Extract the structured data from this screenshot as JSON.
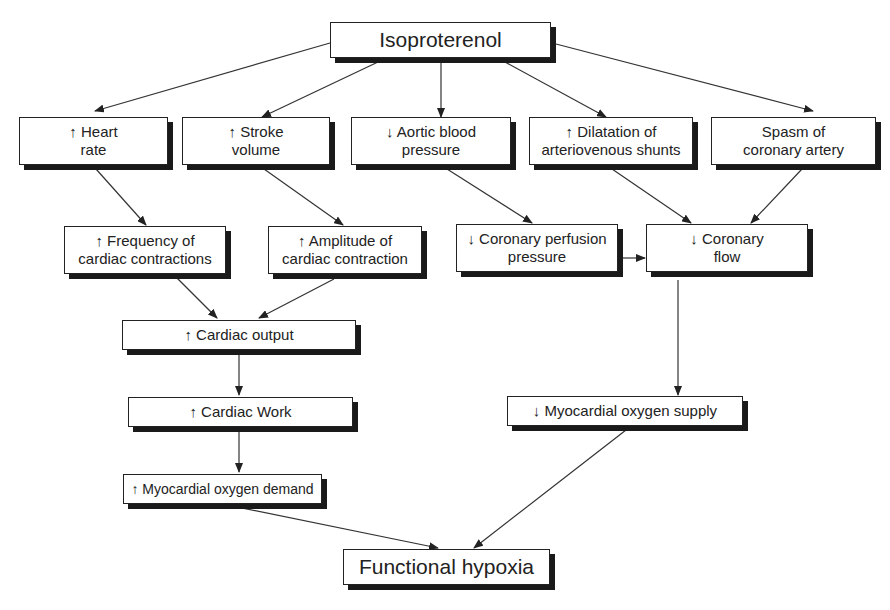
{
  "diagram": {
    "nodes": {
      "isoproterenol": {
        "lines": [
          "Isoproterenol"
        ]
      },
      "heart_rate": {
        "lines": [
          "↑ Heart",
          "rate"
        ]
      },
      "stroke_volume": {
        "lines": [
          "↑ Stroke",
          "volume"
        ]
      },
      "aortic_bp": {
        "lines": [
          "↓ Aortic blood",
          "pressure"
        ]
      },
      "av_shunts": {
        "lines": [
          "↑ Dilatation of",
          "arteriovenous shunts"
        ]
      },
      "coronary_spasm": {
        "lines": [
          "Spasm of",
          "coronary artery"
        ]
      },
      "freq_contractions": {
        "lines": [
          "↑ Frequency of",
          "cardiac contractions"
        ]
      },
      "amp_contraction": {
        "lines": [
          "↑ Amplitude of",
          "cardiac contraction"
        ]
      },
      "coronary_perfusion": {
        "lines": [
          "↓ Coronary perfusion",
          "pressure"
        ]
      },
      "coronary_flow": {
        "lines": [
          "↓ Coronary",
          "flow"
        ]
      },
      "cardiac_output": {
        "lines": [
          "↑ Cardiac output"
        ]
      },
      "cardiac_work": {
        "lines": [
          "↑ Cardiac Work"
        ]
      },
      "mo_supply": {
        "lines": [
          "↓ Myocardial oxygen supply"
        ]
      },
      "mo_demand": {
        "lines": [
          "↑ Myocardial oxygen demand"
        ]
      },
      "functional_hypoxia": {
        "lines": [
          "Functional hypoxia"
        ]
      }
    },
    "edges": [
      {
        "from": "isoproterenol",
        "to": "heart_rate"
      },
      {
        "from": "isoproterenol",
        "to": "stroke_volume"
      },
      {
        "from": "isoproterenol",
        "to": "aortic_bp"
      },
      {
        "from": "isoproterenol",
        "to": "av_shunts"
      },
      {
        "from": "isoproterenol",
        "to": "coronary_spasm"
      },
      {
        "from": "heart_rate",
        "to": "freq_contractions"
      },
      {
        "from": "stroke_volume",
        "to": "amp_contraction"
      },
      {
        "from": "aortic_bp",
        "to": "coronary_perfusion"
      },
      {
        "from": "av_shunts",
        "to": "coronary_flow"
      },
      {
        "from": "coronary_spasm",
        "to": "coronary_flow"
      },
      {
        "from": "coronary_perfusion",
        "to": "coronary_flow"
      },
      {
        "from": "freq_contractions",
        "to": "cardiac_output"
      },
      {
        "from": "amp_contraction",
        "to": "cardiac_output"
      },
      {
        "from": "cardiac_output",
        "to": "cardiac_work"
      },
      {
        "from": "cardiac_work",
        "to": "mo_demand"
      },
      {
        "from": "coronary_flow",
        "to": "mo_supply"
      },
      {
        "from": "mo_demand",
        "to": "functional_hypoxia"
      },
      {
        "from": "mo_supply",
        "to": "functional_hypoxia"
      }
    ],
    "colors": {
      "stroke": "#222222",
      "shadow": "#1a1a1a",
      "background": "#ffffff"
    }
  }
}
